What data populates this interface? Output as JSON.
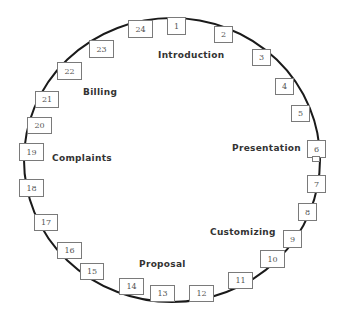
{
  "diagram": {
    "type": "circular process cycle",
    "steps": [
      {
        "n": "1",
        "x": 167,
        "y": 17,
        "w": 19,
        "h": 18
      },
      {
        "n": "2",
        "x": 214,
        "y": 26,
        "w": 19,
        "h": 17
      },
      {
        "n": "3",
        "x": 252,
        "y": 49,
        "w": 19,
        "h": 17
      },
      {
        "n": "4",
        "x": 275,
        "y": 78,
        "w": 19,
        "h": 17
      },
      {
        "n": "5",
        "x": 291,
        "y": 105,
        "w": 19,
        "h": 17
      },
      {
        "n": "6",
        "x": 307,
        "y": 140,
        "w": 19,
        "h": 18
      },
      {
        "n": "7",
        "x": 307,
        "y": 175,
        "w": 19,
        "h": 18
      },
      {
        "n": "8",
        "x": 298,
        "y": 203,
        "w": 19,
        "h": 18
      },
      {
        "n": "9",
        "x": 283,
        "y": 230,
        "w": 19,
        "h": 18
      },
      {
        "n": "10",
        "x": 260,
        "y": 250,
        "w": 25,
        "h": 18
      },
      {
        "n": "11",
        "x": 228,
        "y": 272,
        "w": 25,
        "h": 17
      },
      {
        "n": "12",
        "x": 189,
        "y": 285,
        "w": 25,
        "h": 17
      },
      {
        "n": "13",
        "x": 150,
        "y": 285,
        "w": 25,
        "h": 17
      },
      {
        "n": "14",
        "x": 119,
        "y": 278,
        "w": 25,
        "h": 17
      },
      {
        "n": "15",
        "x": 80,
        "y": 263,
        "w": 24,
        "h": 17
      },
      {
        "n": "16",
        "x": 57,
        "y": 242,
        "w": 25,
        "h": 17
      },
      {
        "n": "17",
        "x": 34,
        "y": 214,
        "w": 24,
        "h": 17
      },
      {
        "n": "18",
        "x": 19,
        "y": 179,
        "w": 25,
        "h": 18
      },
      {
        "n": "19",
        "x": 19,
        "y": 143,
        "w": 25,
        "h": 18
      },
      {
        "n": "20",
        "x": 27,
        "y": 117,
        "w": 25,
        "h": 17
      },
      {
        "n": "21",
        "x": 35,
        "y": 91,
        "w": 24,
        "h": 17
      },
      {
        "n": "22",
        "x": 57,
        "y": 62,
        "w": 25,
        "h": 18
      },
      {
        "n": "23",
        "x": 89,
        "y": 40,
        "w": 25,
        "h": 18
      },
      {
        "n": "24",
        "x": 128,
        "y": 20,
        "w": 25,
        "h": 18
      }
    ],
    "phases": [
      {
        "label": "Introduction",
        "x": 158,
        "y": 50
      },
      {
        "label": "Presentation",
        "x": 232,
        "y": 143
      },
      {
        "label": "Customizing",
        "x": 210,
        "y": 227
      },
      {
        "label": "Proposal",
        "x": 139,
        "y": 259
      },
      {
        "label": "Complaints",
        "x": 52,
        "y": 153
      },
      {
        "label": "Billing",
        "x": 83,
        "y": 87
      }
    ]
  }
}
